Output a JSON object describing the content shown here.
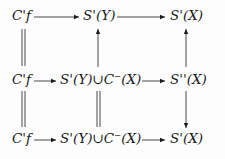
{
  "diagram": {
    "type": "commutative-diagram",
    "rows": [
      {
        "nodes": [
          "C'f",
          "S'(Y)",
          "S'(X)"
        ]
      },
      {
        "nodes": [
          "C'f",
          "S'(Y)∪C⁻(X)",
          "S''(X)"
        ]
      },
      {
        "nodes": [
          "C'f",
          "S'(Y)∪C⁻(X)",
          "S'(X)"
        ]
      }
    ],
    "edges": [
      {
        "from": "r0c0",
        "to": "r0c1",
        "style": "arrow"
      },
      {
        "from": "r0c1",
        "to": "r0c2",
        "style": "arrow"
      },
      {
        "from": "r1c0",
        "to": "r1c1",
        "style": "arrow"
      },
      {
        "from": "r1c1",
        "to": "r1c2",
        "style": "arrow"
      },
      {
        "from": "r2c0",
        "to": "r2c1",
        "style": "arrow"
      },
      {
        "from": "r2c1",
        "to": "r2c2",
        "style": "arrow"
      },
      {
        "from": "r0c0",
        "to": "r1c0",
        "style": "equality"
      },
      {
        "from": "r1c0",
        "to": "r2c0",
        "style": "equality"
      },
      {
        "from": "r1c1",
        "to": "r0c1",
        "style": "arrow"
      },
      {
        "from": "r1c1",
        "to": "r2c1",
        "style": "equality"
      },
      {
        "from": "r1c2",
        "to": "r0c2",
        "style": "arrow"
      },
      {
        "from": "r1c2",
        "to": "r2c2",
        "style": "arrow"
      }
    ]
  }
}
